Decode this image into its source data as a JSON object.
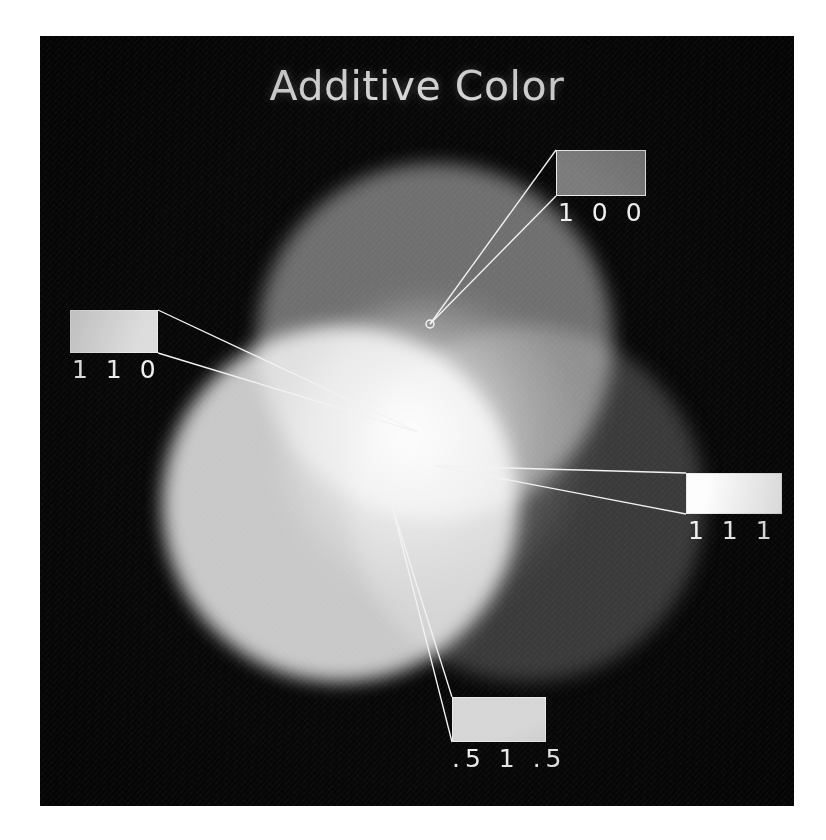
{
  "figure": {
    "title": "Additive Color",
    "background_color": "#070707",
    "plate": {
      "x": 40,
      "y": 36,
      "width": 754,
      "height": 770
    }
  },
  "lobes": [
    {
      "name": "red-lobe",
      "triplet": "100",
      "gray_value": "#6f6f6f",
      "cx": 395,
      "cy": 305,
      "r": 178
    },
    {
      "name": "green-lobe",
      "triplet": "010",
      "gray_value": "#c8c8c8",
      "cx": 300,
      "cy": 468,
      "r": 178
    },
    {
      "name": "blue-lobe",
      "triplet": "001",
      "gray_value": "#3a3a3a",
      "cx": 487,
      "cy": 468,
      "r": 178
    }
  ],
  "callouts": [
    {
      "id": "callout-100",
      "label": "1 0 0",
      "swatch_color": "#7b7b7b",
      "swatch": {
        "x": 516,
        "y": 114,
        "width": 90,
        "height": 46
      },
      "label_align": "left",
      "anchor": {
        "x": 390,
        "y": 288
      },
      "anchor_dot": true
    },
    {
      "id": "callout-110",
      "label": "1 1 0",
      "swatch_color": "#dcdcdc",
      "swatch": {
        "x": 30,
        "y": 274,
        "width": 88,
        "height": 43
      },
      "label_align": "left",
      "anchor": {
        "x": 378,
        "y": 396
      },
      "anchor_dot": false
    },
    {
      "id": "callout-111",
      "label": "1 1 1",
      "swatch_color": "#fdfdfd",
      "swatch": {
        "x": 646,
        "y": 437,
        "width": 96,
        "height": 41
      },
      "label_align": "left",
      "anchor": {
        "x": 396,
        "y": 430
      },
      "anchor_dot": false
    },
    {
      "id": "callout-515",
      "label": ".5 1 .5",
      "swatch_color": "#d6d6d6",
      "swatch": {
        "x": 412,
        "y": 661,
        "width": 94,
        "height": 45
      },
      "label_align": "center",
      "anchor": {
        "x": 352,
        "y": 470
      },
      "anchor_dot": false
    }
  ],
  "chart_data": {
    "type": "diagram",
    "title": "Additive Color",
    "primaries": [
      {
        "name": "Red",
        "triplet": "1 0 0",
        "rendered_gray": "#6f6f6f"
      },
      {
        "name": "Green",
        "triplet": "0 1 0",
        "rendered_gray": "#c8c8c8"
      },
      {
        "name": "Blue",
        "triplet": "0 0 1",
        "rendered_gray": "#3a3a3a"
      }
    ],
    "labeled_samples": [
      {
        "label": "1 0 0",
        "swatch_gray": "#7b7b7b",
        "region": "red circle only"
      },
      {
        "label": "1 1 0",
        "swatch_gray": "#dcdcdc",
        "region": "red + green overlap (yellow)"
      },
      {
        "label": "1 1 1",
        "swatch_gray": "#fdfdfd",
        "region": "all three overlap (white)"
      },
      {
        "label": ".5 1 .5",
        "swatch_gray": "#d6d6d6",
        "region": "partial mixture below center"
      }
    ],
    "legend_position": "inline callouts",
    "grid": false
  }
}
